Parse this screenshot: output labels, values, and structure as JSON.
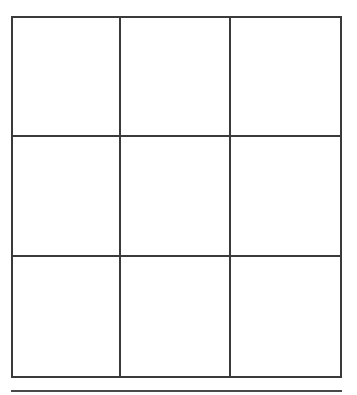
{
  "board": {
    "rows": 3,
    "cols": 3,
    "cells": [
      [
        "",
        "",
        ""
      ],
      [
        "",
        "",
        ""
      ],
      [
        "",
        "",
        ""
      ]
    ],
    "line_color": "#3a3a3a"
  }
}
